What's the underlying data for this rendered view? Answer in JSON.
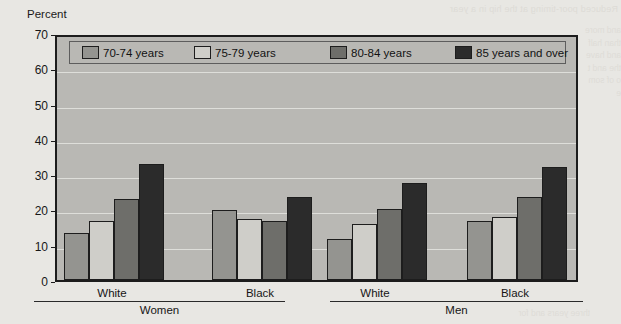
{
  "figure": {
    "y_axis_title": "Percent",
    "background_bleed_top": "Reduced poor-timing at the hip in a year",
    "background_bleed_right": "and more than half and have the and to of some",
    "background_bleed_bottom": "three years and for"
  },
  "legend": {
    "items": [
      {
        "label": "70-74 years",
        "color": "#949490"
      },
      {
        "label": "75-79 years",
        "color": "#cfcec9"
      },
      {
        "label": "80-84 years",
        "color": "#6e6e6a"
      },
      {
        "label": "85 years and over",
        "color": "#2b2b2b"
      }
    ]
  },
  "axes": {
    "y_ticks": [
      "0",
      "10",
      "20",
      "30",
      "40",
      "50",
      "60",
      "70"
    ],
    "group_labels": [
      "White",
      "Black",
      "White",
      "Black"
    ],
    "super_labels": [
      "Women",
      "Men"
    ]
  },
  "chart_data": {
    "type": "bar",
    "title": "",
    "subtitle": "",
    "xlabel": "",
    "ylabel": "Percent",
    "ylim": [
      0,
      70
    ],
    "ytick_step": 10,
    "grid": true,
    "legend_position": "top-inside",
    "categories": [
      "Women - White",
      "Women - Black",
      "Men - White",
      "Men - Black"
    ],
    "group_hierarchy": [
      {
        "sex": "Women",
        "races": [
          "White",
          "Black"
        ]
      },
      {
        "sex": "Men",
        "races": [
          "White",
          "Black"
        ]
      }
    ],
    "series": [
      {
        "name": "70-74 years",
        "color": "#949490",
        "values": [
          13.4,
          19.8,
          11.6,
          16.8
        ]
      },
      {
        "name": "75-79 years",
        "color": "#cfcec9",
        "values": [
          16.8,
          17.3,
          16.0,
          17.8
        ]
      },
      {
        "name": "80-84 years",
        "color": "#6e6e6a",
        "values": [
          23.0,
          16.8,
          20.1,
          23.5
        ]
      },
      {
        "name": "85 years and over",
        "color": "#2b2b2b",
        "values": [
          33.0,
          23.6,
          27.5,
          32.0
        ]
      }
    ]
  }
}
